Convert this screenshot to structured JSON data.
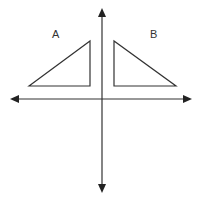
{
  "diagram": {
    "type": "coordinate-plane-reflection",
    "labels": {
      "a": "A",
      "b": "B"
    },
    "colors": {
      "stroke": "#333333",
      "background": "#ffffff"
    },
    "axes": {
      "x_axis": "horizontal with arrowheads both ends",
      "y_axis": "vertical with arrowheads both ends"
    },
    "shapes": [
      {
        "name": "A",
        "kind": "right-triangle",
        "quadrant": "II"
      },
      {
        "name": "B",
        "kind": "right-triangle",
        "quadrant": "I",
        "relation": "reflection of A across y-axis"
      }
    ]
  }
}
